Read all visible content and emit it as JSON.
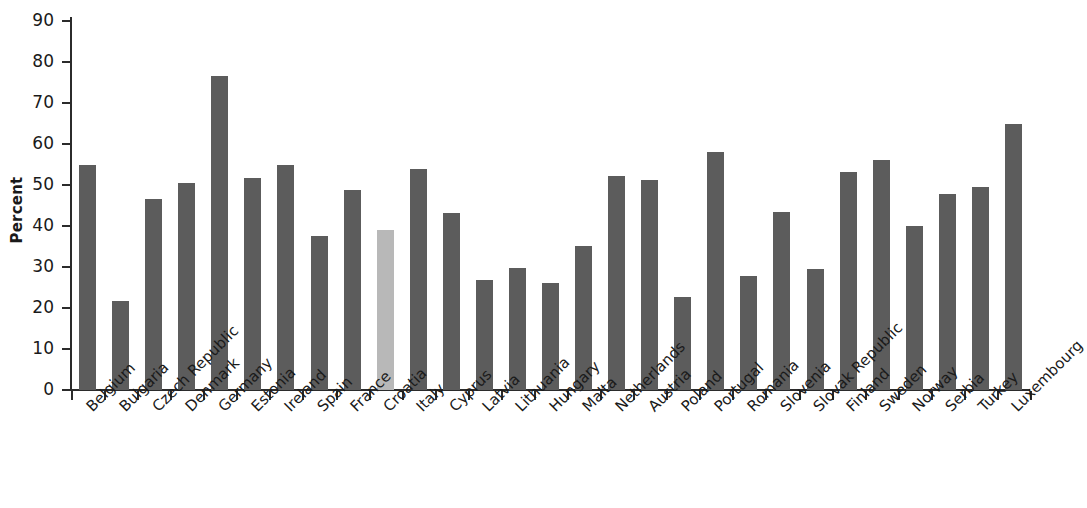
{
  "chart_data": {
    "type": "bar",
    "title": "",
    "xlabel": "",
    "ylabel": "Percent",
    "ylim": [
      0,
      90
    ],
    "ytick_labels": [
      "90",
      "80",
      "70",
      "60",
      "50",
      "40",
      "30",
      "20",
      "10",
      "0"
    ],
    "yticks": [
      90,
      80,
      70,
      60,
      50,
      40,
      30,
      20,
      10,
      0
    ],
    "grid": false,
    "legend": null,
    "highlight_category": "Croatia",
    "colors": {
      "bar": "#5c5c5c",
      "bar_highlight": "#b8b8b8",
      "axis": "#2b2b2b",
      "text": "#1a1a1a",
      "background": "#ffffff"
    },
    "categories": [
      "Belgium",
      "Bulgaria",
      "Czech Republic",
      "Denmark",
      "Germany",
      "Estonia",
      "Ireland",
      "Spain",
      "France",
      "Croatia",
      "Italy",
      "Cyprus",
      "Latvia",
      "Lithuania",
      "Hungary",
      "Malta",
      "Netherlands",
      "Austria",
      "Poland",
      "Portugal",
      "Romania",
      "Slovenia",
      "Slovak Republic",
      "Finland",
      "Sweden",
      "Norway",
      "Serbia",
      "Turkey",
      "Luxembourg"
    ],
    "values": [
      55.0,
      21.7,
      46.5,
      50.4,
      76.7,
      51.8,
      54.8,
      37.5,
      48.8,
      39.0,
      54.0,
      43.2,
      26.8,
      29.8,
      26.2,
      35.2,
      52.3,
      51.3,
      22.7,
      58.0,
      27.7,
      43.3,
      29.5,
      53.1,
      56.1,
      40.0,
      47.8,
      49.5,
      64.9
    ]
  }
}
